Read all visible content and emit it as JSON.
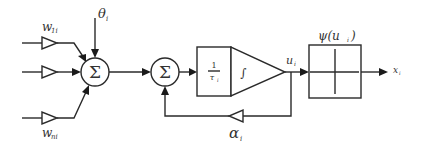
{
  "diagram": {
    "inputs": [
      {
        "weight_label": "w",
        "weight_sub": "1i"
      },
      {
        "weight_label": "",
        "weight_sub": ""
      },
      {
        "weight_label": "w",
        "weight_sub": "ni"
      }
    ],
    "threshold_label": "θ",
    "threshold_sub": "i",
    "sum1_symbol": "Σ",
    "sum2_symbol": "Σ",
    "gain_block": {
      "numerator": "1",
      "denominator": "τ",
      "denominator_sub": "i"
    },
    "integrator_symbol": "∫",
    "state_label": "u",
    "state_sub": "i",
    "activation_label": "ψ(u",
    "activation_sub": "i",
    "activation_close": ")",
    "output_label": "x",
    "output_sub": "i",
    "feedback_label": "α",
    "feedback_sub": "i"
  }
}
